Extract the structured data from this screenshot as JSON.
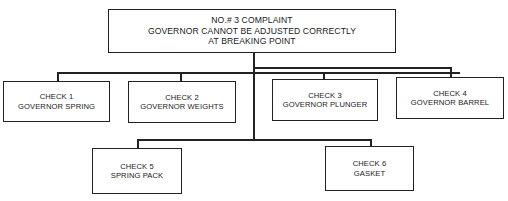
{
  "root": {
    "lines": [
      "NO.# 3 COMPLAINT",
      "GOVERNOR CANNOT BE ADJUSTED CORRECTLY",
      "AT BREAKING POINT"
    ]
  },
  "checks": [
    {
      "id": "check-1",
      "title": "CHECK 1",
      "item": "GOVERNOR SPRING"
    },
    {
      "id": "check-2",
      "title": "CHECK 2",
      "item": "GOVERNOR WEIGHTS"
    },
    {
      "id": "check-3",
      "title": "CHECK 3",
      "item": "GOVERNOR PLUNGER"
    },
    {
      "id": "check-4",
      "title": "CHECK 4",
      "item": "GOVERNOR BARREL"
    },
    {
      "id": "check-5",
      "title": "CHECK 5",
      "item": "SPRING PACK"
    },
    {
      "id": "check-6",
      "title": "CHECK 6",
      "item": "GASKET"
    }
  ],
  "colors": {
    "stroke": "#222222",
    "background": "#ffffff"
  }
}
